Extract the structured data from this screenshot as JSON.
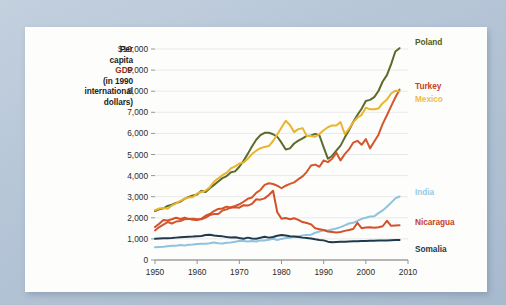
{
  "figure": {
    "background_color": "#b9c8da",
    "card_color": "#fdfdfc"
  },
  "axis_title": {
    "line1": "Per",
    "line2": "capita",
    "line3": "GDP",
    "line4": "(in 1990",
    "line5": "international",
    "line6": "dollars)",
    "gdp_color": "#8a3324"
  },
  "chart_data": {
    "type": "line",
    "title": "",
    "xlabel": "",
    "ylabel": "Per capita GDP (in 1990 international dollars)",
    "xlim": [
      1950,
      2010
    ],
    "ylim": [
      0,
      10000
    ],
    "grid": true,
    "legend_position": "right-of-line-ends",
    "x_ticks": [
      1950,
      1960,
      1970,
      1980,
      1990,
      2000,
      2010
    ],
    "x_tick_labels": [
      "1950",
      "1960",
      "1970",
      "1980",
      "1990",
      "2000",
      "2010"
    ],
    "y_ticks": [
      0,
      1000,
      2000,
      3000,
      4000,
      5000,
      6000,
      7000,
      8000,
      9000,
      10000
    ],
    "y_tick_labels": [
      "0",
      "1,000",
      "2,000",
      "3,000",
      "4,000",
      "5,000",
      "6,000",
      "7,000",
      "8,000",
      "9,000",
      "$10,000"
    ],
    "series": [
      {
        "name": "Poland",
        "color": "#5d6b2a",
        "label_color": "#4e5c22",
        "x": [
          1950,
          1951,
          1952,
          1953,
          1954,
          1955,
          1956,
          1957,
          1958,
          1959,
          1960,
          1961,
          1962,
          1963,
          1964,
          1965,
          1966,
          1967,
          1968,
          1969,
          1970,
          1971,
          1972,
          1973,
          1974,
          1975,
          1976,
          1977,
          1978,
          1979,
          1980,
          1981,
          1982,
          1983,
          1984,
          1985,
          1986,
          1987,
          1988,
          1989,
          1990,
          1991,
          1992,
          1993,
          1994,
          1995,
          1996,
          1997,
          1998,
          1999,
          2000,
          2001,
          2002,
          2003,
          2004,
          2005,
          2006,
          2007,
          2008
        ],
        "values": [
          2320,
          2400,
          2450,
          2560,
          2620,
          2700,
          2760,
          2900,
          2990,
          3060,
          3100,
          3280,
          3220,
          3400,
          3560,
          3720,
          3880,
          3980,
          4160,
          4200,
          4420,
          4700,
          5030,
          5380,
          5700,
          5920,
          6030,
          6030,
          5960,
          5840,
          5560,
          5240,
          5290,
          5520,
          5660,
          5760,
          5880,
          5900,
          5980,
          5900,
          5340,
          4800,
          4930,
          5180,
          5420,
          5800,
          6150,
          6540,
          6870,
          7170,
          7540,
          7590,
          7720,
          8010,
          8460,
          8760,
          9280,
          9880,
          10040
        ]
      },
      {
        "name": "Turkey",
        "color": "#d4562c",
        "label_color": "#c8431f",
        "x": [
          1950,
          1951,
          1952,
          1953,
          1954,
          1955,
          1956,
          1957,
          1958,
          1959,
          1960,
          1961,
          1962,
          1963,
          1964,
          1965,
          1966,
          1967,
          1968,
          1969,
          1970,
          1971,
          1972,
          1973,
          1974,
          1975,
          1976,
          1977,
          1978,
          1979,
          1980,
          1981,
          1982,
          1983,
          1984,
          1985,
          1986,
          1987,
          1988,
          1989,
          1990,
          1991,
          1992,
          1993,
          1994,
          1995,
          1996,
          1997,
          1998,
          1999,
          2000,
          2001,
          2002,
          2003,
          2004,
          2005,
          2006,
          2007,
          2008
        ],
        "values": [
          1400,
          1560,
          1680,
          1800,
          1730,
          1820,
          1850,
          1930,
          1940,
          1960,
          1930,
          1930,
          2010,
          2130,
          2180,
          2180,
          2350,
          2400,
          2500,
          2560,
          2640,
          2760,
          2900,
          2960,
          3180,
          3320,
          3560,
          3640,
          3600,
          3520,
          3400,
          3520,
          3610,
          3680,
          3830,
          3960,
          4180,
          4480,
          4520,
          4420,
          4720,
          4640,
          4800,
          5080,
          4720,
          5020,
          5240,
          5560,
          5650,
          5460,
          5730,
          5290,
          5620,
          5940,
          6450,
          6860,
          7290,
          7700,
          8080
        ]
      },
      {
        "name": "Mexico",
        "color": "#e8b52e",
        "label_color": "#edbd4a",
        "x": [
          1950,
          1951,
          1952,
          1953,
          1954,
          1955,
          1956,
          1957,
          1958,
          1959,
          1960,
          1961,
          1962,
          1963,
          1964,
          1965,
          1966,
          1967,
          1968,
          1969,
          1970,
          1971,
          1972,
          1973,
          1974,
          1975,
          1976,
          1977,
          1978,
          1979,
          1980,
          1981,
          1982,
          1983,
          1984,
          1985,
          1986,
          1987,
          1988,
          1989,
          1990,
          1991,
          1992,
          1993,
          1994,
          1995,
          1996,
          1997,
          1998,
          1999,
          2000,
          2001,
          2002,
          2003,
          2004,
          2005,
          2006,
          2007,
          2008
        ],
        "values": [
          2360,
          2440,
          2460,
          2430,
          2580,
          2680,
          2800,
          2900,
          2960,
          2990,
          3150,
          3220,
          3290,
          3450,
          3720,
          3870,
          4020,
          4140,
          4340,
          4440,
          4570,
          4620,
          4800,
          5020,
          5180,
          5300,
          5360,
          5400,
          5640,
          5950,
          6280,
          6600,
          6400,
          6060,
          6200,
          6250,
          5880,
          5880,
          5840,
          5970,
          6150,
          6290,
          6380,
          6370,
          6540,
          5970,
          6220,
          6520,
          6740,
          6880,
          7220,
          7140,
          7140,
          7180,
          7430,
          7610,
          7890,
          8020,
          7990
        ]
      },
      {
        "name": "India",
        "color": "#8fc2de",
        "label_color": "#9bc9e2",
        "x": [
          1950,
          1951,
          1952,
          1953,
          1954,
          1955,
          1956,
          1957,
          1958,
          1959,
          1960,
          1961,
          1962,
          1963,
          1964,
          1965,
          1966,
          1967,
          1968,
          1969,
          1970,
          1971,
          1972,
          1973,
          1974,
          1975,
          1976,
          1977,
          1978,
          1979,
          1980,
          1981,
          1982,
          1983,
          1984,
          1985,
          1986,
          1987,
          1988,
          1989,
          1990,
          1991,
          1992,
          1993,
          1994,
          1995,
          1996,
          1997,
          1998,
          1999,
          2000,
          2001,
          2002,
          2003,
          2004,
          2005,
          2006,
          2007,
          2008
        ],
        "values": [
          610,
          620,
          630,
          650,
          670,
          680,
          710,
          690,
          720,
          730,
          760,
          770,
          770,
          790,
          830,
          790,
          780,
          820,
          830,
          860,
          910,
          900,
          880,
          900,
          880,
          930,
          920,
          960,
          1010,
          950,
          1000,
          1040,
          1050,
          1100,
          1130,
          1160,
          1190,
          1200,
          1290,
          1350,
          1410,
          1400,
          1450,
          1490,
          1560,
          1640,
          1730,
          1760,
          1850,
          1950,
          2000,
          2060,
          2070,
          2220,
          2350,
          2520,
          2720,
          2920,
          3010
        ]
      },
      {
        "name": "Nicaragua",
        "color": "#d4502a",
        "label_color": "#c8431f",
        "x": [
          1950,
          1951,
          1952,
          1953,
          1954,
          1955,
          1956,
          1957,
          1958,
          1959,
          1960,
          1961,
          1962,
          1963,
          1964,
          1965,
          1966,
          1967,
          1968,
          1969,
          1970,
          1971,
          1972,
          1973,
          1974,
          1975,
          1976,
          1977,
          1978,
          1979,
          1980,
          1981,
          1982,
          1983,
          1984,
          1985,
          1986,
          1987,
          1988,
          1989,
          1990,
          1991,
          1992,
          1993,
          1994,
          1995,
          1996,
          1997,
          1998,
          1999,
          2000,
          2001,
          2002,
          2003,
          2004,
          2005,
          2006,
          2007,
          2008
        ],
        "values": [
          1560,
          1720,
          1900,
          1870,
          1930,
          2000,
          1940,
          2010,
          1950,
          1910,
          1890,
          1950,
          2100,
          2180,
          2320,
          2420,
          2440,
          2530,
          2480,
          2500,
          2480,
          2600,
          2580,
          2660,
          2880,
          2860,
          2920,
          3080,
          3280,
          2260,
          1960,
          1990,
          1930,
          1980,
          1900,
          1800,
          1750,
          1690,
          1500,
          1460,
          1420,
          1350,
          1330,
          1300,
          1330,
          1380,
          1420,
          1470,
          1760,
          1510,
          1540,
          1550,
          1530,
          1550,
          1600,
          1860,
          1620,
          1640,
          1650
        ]
      },
      {
        "name": "Somalia",
        "color": "#1f3a4d",
        "label_color": "#1f3a4d",
        "x": [
          1950,
          1951,
          1952,
          1953,
          1954,
          1955,
          1956,
          1957,
          1958,
          1959,
          1960,
          1961,
          1962,
          1963,
          1964,
          1965,
          1966,
          1967,
          1968,
          1969,
          1970,
          1971,
          1972,
          1973,
          1974,
          1975,
          1976,
          1977,
          1978,
          1979,
          1980,
          1981,
          1982,
          1983,
          1984,
          1985,
          1986,
          1987,
          1988,
          1989,
          1990,
          1991,
          1992,
          1993,
          1994,
          1995,
          1996,
          1997,
          1998,
          1999,
          2000,
          2001,
          2002,
          2003,
          2004,
          2005,
          2006,
          2007,
          2008
        ],
        "values": [
          1010,
          1020,
          1030,
          1030,
          1040,
          1060,
          1080,
          1090,
          1100,
          1110,
          1130,
          1140,
          1180,
          1200,
          1160,
          1140,
          1120,
          1090,
          1070,
          1080,
          1040,
          1010,
          1060,
          1020,
          1010,
          1050,
          1100,
          1060,
          1090,
          1150,
          1180,
          1160,
          1130,
          1110,
          1090,
          1060,
          1040,
          1020,
          980,
          950,
          930,
          870,
          840,
          850,
          860,
          870,
          880,
          890,
          890,
          900,
          900,
          910,
          910,
          920,
          930,
          930,
          940,
          950,
          950
        ]
      }
    ]
  },
  "legend": [
    {
      "label": "Poland",
      "color": "#4e5c22"
    },
    {
      "label": "Turkey",
      "color": "#c8431f"
    },
    {
      "label": "Mexico",
      "color": "#edbd4a"
    },
    {
      "label": "India",
      "color": "#9bc9e2"
    },
    {
      "label": "Nicaragua",
      "color": "#c8431f"
    },
    {
      "label": "Somalia",
      "color": "#1f3a4d"
    }
  ]
}
